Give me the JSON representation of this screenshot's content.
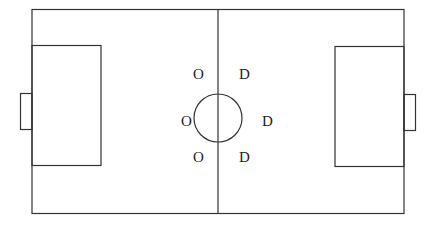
{
  "diagram": {
    "type": "soccer-field-formation",
    "line_color": "#333333",
    "background": "#ffffff",
    "left_team_players": [
      {
        "label": "O",
        "x": 198,
        "y": 78
      },
      {
        "label": "O",
        "x": 186,
        "y": 125
      },
      {
        "label": "O",
        "x": 198,
        "y": 162
      }
    ],
    "right_team_players": [
      {
        "label": "D",
        "x": 244,
        "y": 78
      },
      {
        "label": "D",
        "x": 267,
        "y": 125
      },
      {
        "label": "D",
        "x": 244,
        "y": 162
      }
    ]
  }
}
